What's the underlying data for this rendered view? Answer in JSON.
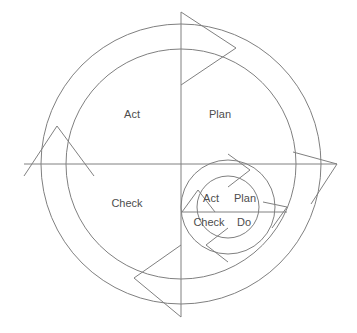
{
  "diagram": {
    "type": "cycle-diagram",
    "background_color": "#ffffff",
    "stroke_color": "#808080",
    "text_color": "#4d4d4d",
    "direction": "clockwise",
    "outer_cycle": {
      "name": "outer-pdca-cycle",
      "center_x": 181,
      "center_y": 164,
      "outer_radius": 140,
      "inner_radius": 115,
      "quadrant_labels": [
        {
          "key": "plan",
          "label": "Plan",
          "x": 220,
          "y": 115
        },
        {
          "key": "act",
          "label": "Act",
          "x": 132,
          "y": 115
        },
        {
          "key": "check",
          "label": "Check",
          "x": 127,
          "y": 204
        },
        {
          "key": "do",
          "label": "Do",
          "x": 228,
          "y": 204,
          "visible": false
        }
      ],
      "arrow_directions": [
        "right",
        "down",
        "left",
        "up"
      ]
    },
    "inner_cycle": {
      "name": "inner-pdca-cycle",
      "center_x": 228,
      "center_y": 207,
      "outer_radius": 47,
      "inner_radius": 31,
      "quadrant_labels": [
        {
          "key": "plan",
          "label": "Plan",
          "x": 245,
          "y": 199
        },
        {
          "key": "act",
          "label": "Act",
          "x": 211,
          "y": 199
        },
        {
          "key": "check",
          "label": "Check",
          "x": 209,
          "y": 223
        },
        {
          "key": "do",
          "label": "Do",
          "x": 244,
          "y": 223
        }
      ],
      "arrow_directions": [
        "right",
        "down",
        "left",
        "up"
      ]
    },
    "axes": {
      "vertical_label": "vertical-axis",
      "horizontal_label": "horizontal-axis"
    }
  }
}
